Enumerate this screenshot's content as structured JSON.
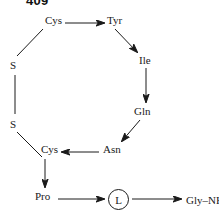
{
  "page": {
    "number": "409",
    "width": 219,
    "height": 216,
    "background_color": "#ffffff",
    "ink_color": "#1a1a1a"
  },
  "diagram": {
    "type": "cyclic-peptide-sequence",
    "nodes": [
      {
        "id": "cys1",
        "label": "Cys",
        "x": 45,
        "y": 19
      },
      {
        "id": "tyr",
        "label": "Tyr",
        "x": 107,
        "y": 19
      },
      {
        "id": "ile",
        "label": "Ile",
        "x": 139,
        "y": 59
      },
      {
        "id": "gln",
        "label": "Gln",
        "x": 134,
        "y": 110
      },
      {
        "id": "asn",
        "label": "Asn",
        "x": 103,
        "y": 148
      },
      {
        "id": "cys2",
        "label": "Cys",
        "x": 41,
        "y": 148
      },
      {
        "id": "pro",
        "label": "Pro",
        "x": 35,
        "y": 195
      },
      {
        "id": "s_top",
        "label": "S",
        "x": 10,
        "y": 64
      },
      {
        "id": "s_bot",
        "label": "S",
        "x": 10,
        "y": 123
      },
      {
        "id": "leu",
        "label": "L",
        "x": 108,
        "y": 190
      },
      {
        "id": "gly",
        "label": "Gly–NH",
        "subscript": "2",
        "x": 186,
        "y": 195
      }
    ],
    "edges": [
      {
        "from": "cys1",
        "to": "tyr",
        "style": "arrow"
      },
      {
        "from": "tyr",
        "to": "ile",
        "style": "arrow"
      },
      {
        "from": "ile",
        "to": "gln",
        "style": "arrow"
      },
      {
        "from": "gln",
        "to": "asn",
        "style": "arrow"
      },
      {
        "from": "asn",
        "to": "cys2",
        "style": "arrow"
      },
      {
        "from": "cys2",
        "to": "pro",
        "style": "arrow"
      },
      {
        "from": "pro",
        "to": "leu",
        "style": "arrow"
      },
      {
        "from": "leu",
        "to": "gly",
        "style": "arrow"
      },
      {
        "from": "cys1",
        "to": "s_top",
        "style": "plain"
      },
      {
        "from": "s_top",
        "to": "s_bot",
        "style": "plain"
      },
      {
        "from": "s_bot",
        "to": "cys2",
        "style": "plain"
      }
    ]
  }
}
